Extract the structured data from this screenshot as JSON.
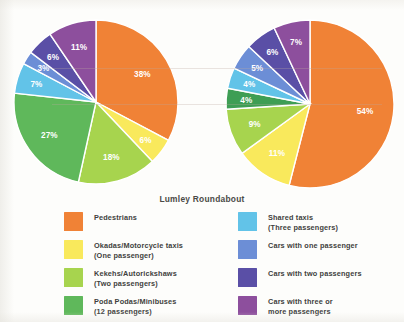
{
  "chart_data": [
    {
      "type": "pie",
      "name": "left-pie",
      "title": "",
      "categories": [
        "Pedestrians",
        "Okadas/Motorcycle taxis (One passenger)",
        "Kekehs/Autorickshaws (Two passengers)",
        "Poda Podas/Minibuses (12 passengers)",
        "Shared taxis (Three passengers)",
        "Cars with one passenger",
        "Cars with two passengers",
        "Cars with three or more passengers"
      ],
      "values": [
        38,
        6,
        18,
        27,
        7,
        3,
        6,
        11
      ],
      "labels": [
        "38%",
        "6%",
        "18%",
        "27%",
        "7%",
        "3%",
        "6%",
        "11%"
      ],
      "colors": [
        "#F08236",
        "#F9E95C",
        "#A7D44E",
        "#5FB85B",
        "#62C3E8",
        "#6C8ED6",
        "#5A4FA6",
        "#8D4F9D"
      ],
      "start_angle_deg": 0,
      "direction": "clockwise",
      "legend": "below"
    },
    {
      "type": "pie",
      "name": "right-pie",
      "title": "",
      "categories": [
        "Pedestrians",
        "Okadas/Motorcycle taxis (One passenger)",
        "Kekehs/Autorickshaws (Two passengers)",
        "Poda Podas/Minibuses (12 passengers)",
        "Shared taxis (Three passengers)",
        "Cars with one passenger",
        "Cars with two passengers",
        "Cars with three or more passengers"
      ],
      "values": [
        54,
        11,
        9,
        4,
        4,
        5,
        6,
        7
      ],
      "labels": [
        "54%",
        "11%",
        "9%",
        "4%",
        "4%",
        "5%",
        "6%",
        "7%"
      ],
      "colors": [
        "#F08236",
        "#F9E95C",
        "#A7D44E",
        "#3E9E54",
        "#62C3E8",
        "#6C8ED6",
        "#5A4FA6",
        "#8D4F9D"
      ],
      "start_angle_deg": 0,
      "direction": "clockwise",
      "legend": "below"
    }
  ],
  "figure": {
    "title": "Lumley Roundabout"
  },
  "legend": {
    "left_column": [
      {
        "color": "#F08236",
        "label": "Pedestrians"
      },
      {
        "color": "#F9E95C",
        "label": "Okadas/Motorcycle taxis\n(One passenger)"
      },
      {
        "color": "#A7D44E",
        "label": "Kekehs/Autorickshaws\n(Two passengers)"
      },
      {
        "color": "#5FB85B",
        "label": "Poda Podas/Minibuses\n(12 passengers)"
      }
    ],
    "right_column": [
      {
        "color": "#62C3E8",
        "label": "Shared taxis\n(Three passengers)"
      },
      {
        "color": "#6C8ED6",
        "label": "Cars with one passenger"
      },
      {
        "color": "#5A4FA6",
        "label": "Cars with two passengers"
      },
      {
        "color": "#8D4F9D",
        "label": "Cars with three or\nmore passengers"
      }
    ]
  }
}
